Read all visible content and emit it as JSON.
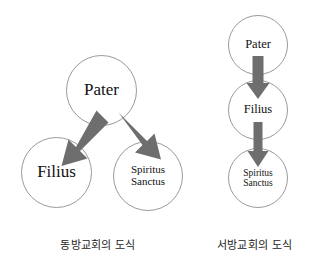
{
  "figure": {
    "background_color": "#ffffff",
    "width": 313,
    "height": 272,
    "circle_stroke_color": "#9a9a9a",
    "arrow_color": "#6e6e6e",
    "text_color": "#111111"
  },
  "diagrams": [
    {
      "id": "east",
      "caption": "동방교회의 도식",
      "layout": "triangular",
      "nodes": [
        {
          "id": "pater",
          "label": "Pater"
        },
        {
          "id": "filius",
          "label": "Filius"
        },
        {
          "id": "spiritus",
          "label": "Spiritus\nSanctus"
        }
      ],
      "arrows": [
        {
          "from": "pater",
          "to": "filius",
          "direction": "down-left"
        },
        {
          "from": "pater",
          "to": "spiritus",
          "direction": "down-right"
        }
      ]
    },
    {
      "id": "west",
      "caption": "서방교회의 도식",
      "layout": "vertical-chain",
      "nodes": [
        {
          "id": "pater",
          "label": "Pater"
        },
        {
          "id": "filius",
          "label": "Filius"
        },
        {
          "id": "spiritus",
          "label": "Spiritus\nSanctus"
        }
      ],
      "arrows": [
        {
          "from": "pater",
          "to": "filius",
          "direction": "down"
        },
        {
          "from": "filius",
          "to": "spiritus",
          "direction": "down"
        }
      ]
    }
  ]
}
